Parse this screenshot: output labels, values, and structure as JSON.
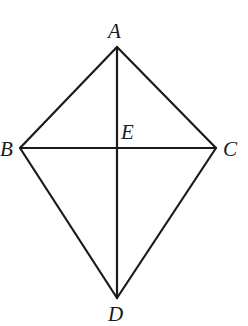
{
  "diagram": {
    "type": "kite-quadrilateral",
    "points": {
      "A": {
        "x": 117,
        "y": 47
      },
      "B": {
        "x": 20,
        "y": 148
      },
      "C": {
        "x": 216,
        "y": 148
      },
      "D": {
        "x": 117,
        "y": 298
      },
      "E": {
        "x": 117,
        "y": 148
      }
    },
    "labels": {
      "A": "A",
      "B": "B",
      "C": "C",
      "D": "D",
      "E": "E"
    },
    "segments": [
      "AB",
      "AC",
      "BD",
      "CD",
      "AD",
      "BC"
    ],
    "colors": {
      "stroke": "#1a1a1a",
      "background": "#ffffff"
    }
  }
}
